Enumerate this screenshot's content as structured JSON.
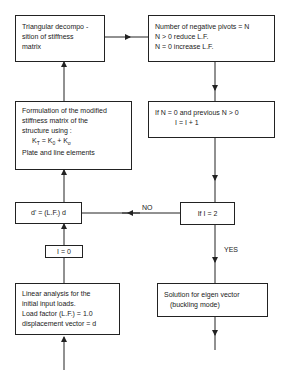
{
  "flowchart": {
    "boxes": {
      "triangular": {
        "lines": [
          "Triangular decompo -",
          "sition of stiffness",
          "matrix"
        ]
      },
      "pivots": {
        "lines": [
          "Number of negative pivots = N",
          "N > 0  reduce L.F.",
          "N = 0  increase L.F."
        ]
      },
      "formulation": {
        "lines": [
          "Formulation of the modified",
          "stiffness matrix of the",
          "structure using :",
          "Plate and line elements"
        ],
        "eq_K": "K",
        "eq_T": "T",
        "eq_eq": "= ",
        "eq_K0": "K",
        "eq_0": "0",
        "eq_plus": "+ ",
        "eq_Ks": "K",
        "eq_s": "σ"
      },
      "check_n": {
        "lines": [
          "If N = 0 and previous N > 0",
          "I = I + 1"
        ]
      },
      "displacement": {
        "text": "d' = (L.F.) d"
      },
      "check_i": {
        "text": "If  I = 2"
      },
      "init_i": {
        "text": "I = 0"
      },
      "linear": {
        "lines": [
          "Linear analysis for the",
          "initial  input loads.",
          "Load factor (L.F.) = 1.0",
          "displacement vector = d"
        ]
      },
      "eigen": {
        "lines": [
          "Solution for eigen vector",
          "(buckling mode)"
        ]
      }
    },
    "edge_labels": {
      "no": "NO",
      "yes": "YES"
    }
  }
}
